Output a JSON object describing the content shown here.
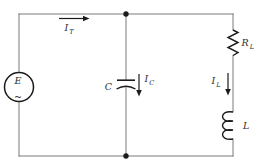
{
  "circuit": {
    "source": {
      "label": "E",
      "waveform_symbol": "~"
    },
    "currents": {
      "total": {
        "base": "I",
        "sub": "T"
      },
      "capacitor": {
        "base": "I",
        "sub": "C"
      },
      "inductor": {
        "base": "I",
        "sub": "L"
      }
    },
    "components": {
      "capacitor": {
        "label": "C"
      },
      "resistor": {
        "base": "R",
        "sub": "L"
      },
      "inductor": {
        "label": "L"
      }
    },
    "colors": {
      "background": "#ffffff",
      "wire": "#7a7a7a",
      "component": "#1b1b1b",
      "label": "#2e2e2e"
    }
  }
}
